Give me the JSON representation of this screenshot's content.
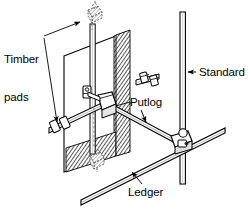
{
  "figure": {
    "background_color": "#ffffff",
    "line_color": "#000000",
    "hatch_color": "#4a4a4a",
    "width": 248,
    "height": 208
  },
  "labels": {
    "timber_pads_line1": "Timber",
    "timber_pads_line2": "pads",
    "standard": "Standard",
    "putlog": "Putlog",
    "ledger": "Ledger"
  },
  "components": {
    "wall_panel": "wall-panel",
    "wall_return_face": "wall-return-face-hatched",
    "standard_left": "left-standard-tube",
    "standard_right": "right-standard-tube",
    "putlog_tube": "putlog-tube",
    "ledger_tube": "ledger-tube",
    "transom_tube": "transom-tube",
    "upper_timber_pad": "upper-timber-pad",
    "lower_timber_pad": "lower-timber-pad",
    "coupler_center": "center-coupler",
    "coupler_right": "right-standard-coupler",
    "coupler_left": "left-end-coupler",
    "coupler_upper": "upper-wall-coupler"
  },
  "leaders": {
    "timber_pads_upper_target": "upper-timber-pad",
    "timber_pads_lower_target": "lower-timber-pad",
    "standard_target": "right-standard-tube",
    "putlog_target": "putlog-tube",
    "ledger_target": "ledger-tube"
  }
}
